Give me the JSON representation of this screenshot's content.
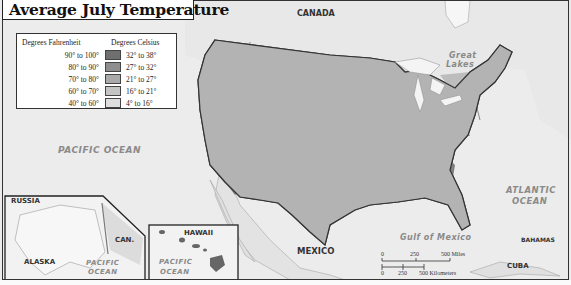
{
  "title": "Average July Temperature",
  "legend": {
    "header_fahrenheit": "Degrees Fahrenheit",
    "header_celsius": "Degrees Celsius",
    "rows": [
      {
        "fahrenheit": "90° to 100°",
        "celsius": "32° to 38°",
        "color": "#6f6f6f"
      },
      {
        "fahrenheit": "80° to 90°",
        "celsius": "27° to 32°",
        "color": "#8e8e8e"
      },
      {
        "fahrenheit": "70° to 80°",
        "celsius": "21° to 27°",
        "color": "#a9a9a9"
      },
      {
        "fahrenheit": "60° to 70°",
        "celsius": "16° to 21°",
        "color": "#c4c4c4"
      },
      {
        "fahrenheit": "40° to 60°",
        "celsius": "4° to 16°",
        "color": "#dedede"
      }
    ]
  },
  "labels": {
    "canada": "CANADA",
    "great_lakes_1": "Great",
    "great_lakes_2": "Lakes",
    "pacific_ocean": "PACIFIC OCEAN",
    "atlantic_1": "ATLANTIC",
    "atlantic_2": "OCEAN",
    "mexico": "MEXICO",
    "gulf": "Gulf of Mexico",
    "bahamas": "BAHAMAS",
    "cuba": "CUBA"
  },
  "insets": {
    "alaska": {
      "russia": "RUSSIA",
      "canada": "CAN.",
      "alaska": "ALASKA",
      "ocean_1": "PACIFIC",
      "ocean_2": "OCEAN"
    },
    "hawaii": {
      "hawaii": "HAWAII",
      "ocean_1": "PACIFIC",
      "ocean_2": "OCEAN"
    }
  },
  "scale_bar": {
    "miles": [
      "0",
      "250",
      "500 Miles"
    ],
    "kilometers": [
      "0",
      "250",
      "500 Kilometers"
    ]
  },
  "colors": {
    "water": "#ececec",
    "land_foreign": "#e4e4e4",
    "border": "#3a3a3a"
  }
}
